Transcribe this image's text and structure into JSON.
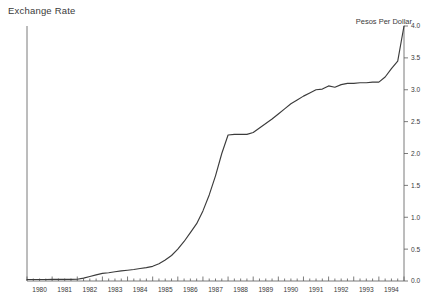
{
  "chart_data": {
    "type": "line",
    "title": "Exchange Rate",
    "ylabel": "Pesos Per Dollar",
    "xlabel": "",
    "ylim": [
      0.0,
      4.0
    ],
    "xlim": [
      1980.0,
      1995.0
    ],
    "grid": false,
    "legend": "none",
    "y_axis_position": "right",
    "ytick_labels": [
      "0.0",
      "0.5",
      "1.0",
      "1.5",
      "2.0",
      "2.5",
      "3.0",
      "3.5",
      "4.0"
    ],
    "ytick_values": [
      0.0,
      0.5,
      1.0,
      1.5,
      2.0,
      2.5,
      3.0,
      3.5,
      4.0
    ],
    "xtick_labels": [
      "1980",
      "1981",
      "1982",
      "1983",
      "1984",
      "1985",
      "1986",
      "1987",
      "1988",
      "1989",
      "1990",
      "1991",
      "1992",
      "1993",
      "1994"
    ],
    "xtick_values": [
      1980,
      1981,
      1982,
      1983,
      1984,
      1985,
      1986,
      1987,
      1988,
      1989,
      1990,
      1991,
      1992,
      1993,
      1994
    ],
    "x_minor_tick_interval": 0.25,
    "series": [
      {
        "name": "Pesos Per Dollar",
        "color": "#3c3c3c",
        "x": [
          1980.0,
          1980.25,
          1980.5,
          1980.75,
          1981.0,
          1981.25,
          1981.5,
          1981.75,
          1982.0,
          1982.25,
          1982.5,
          1982.75,
          1983.0,
          1983.25,
          1983.5,
          1983.75,
          1984.0,
          1984.25,
          1984.5,
          1984.75,
          1985.0,
          1985.25,
          1985.5,
          1985.75,
          1986.0,
          1986.25,
          1986.5,
          1986.75,
          1987.0,
          1987.25,
          1987.5,
          1987.75,
          1988.0,
          1988.25,
          1988.5,
          1988.75,
          1989.0,
          1989.25,
          1989.5,
          1989.75,
          1990.0,
          1990.25,
          1990.5,
          1990.75,
          1991.0,
          1991.25,
          1991.5,
          1991.75,
          1992.0,
          1992.25,
          1992.5,
          1992.75,
          1993.0,
          1993.25,
          1993.5,
          1993.75,
          1994.0,
          1994.25,
          1994.5,
          1994.75,
          1995.0
        ],
        "y": [
          0.023,
          0.023,
          0.024,
          0.024,
          0.025,
          0.025,
          0.026,
          0.026,
          0.027,
          0.046,
          0.07,
          0.096,
          0.12,
          0.13,
          0.145,
          0.158,
          0.168,
          0.18,
          0.196,
          0.21,
          0.23,
          0.27,
          0.33,
          0.4,
          0.5,
          0.62,
          0.76,
          0.9,
          1.1,
          1.35,
          1.65,
          2.0,
          2.29,
          2.3,
          2.3,
          2.3,
          2.33,
          2.4,
          2.47,
          2.54,
          2.62,
          2.7,
          2.78,
          2.84,
          2.9,
          2.95,
          3.0,
          3.01,
          3.06,
          3.04,
          3.08,
          3.1,
          3.1,
          3.11,
          3.11,
          3.12,
          3.12,
          3.2,
          3.33,
          3.45,
          4.0
        ]
      }
    ]
  }
}
